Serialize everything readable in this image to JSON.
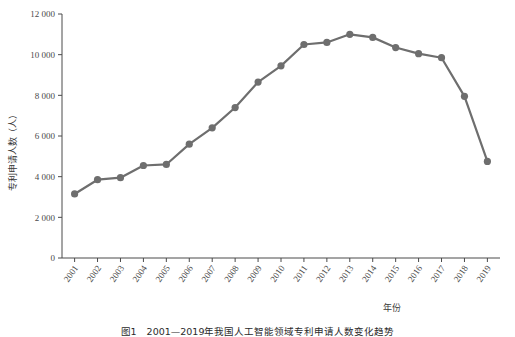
{
  "chart_data": {
    "type": "line",
    "title": "",
    "xlabel": "年份",
    "ylabel": "专利申请人数（人）",
    "categories": [
      "2001",
      "2002",
      "2003",
      "2004",
      "2005",
      "2006",
      "2007",
      "2008",
      "2009",
      "2010",
      "2011",
      "2012",
      "2013",
      "2014",
      "2015",
      "2016",
      "2017",
      "2018",
      "2019"
    ],
    "values": [
      3150,
      3850,
      3950,
      4550,
      4600,
      5600,
      6400,
      7400,
      8650,
      9450,
      10500,
      10600,
      11000,
      10850,
      10350,
      10050,
      9850,
      7950,
      4750
    ],
    "series": [
      {
        "name": "专利申请人数",
        "values": [
          3150,
          3850,
          3950,
          4550,
          4600,
          5600,
          6400,
          7400,
          8650,
          9450,
          10500,
          10600,
          11000,
          10850,
          10350,
          10050,
          9850,
          7950,
          4750
        ]
      }
    ],
    "ylim": [
      0,
      12000
    ],
    "ytick_labels": [
      "0",
      "2 000",
      "4 000",
      "6 000",
      "8 000",
      "10 000",
      "12 000"
    ],
    "ytick_values": [
      0,
      2000,
      4000,
      6000,
      8000,
      10000,
      12000
    ],
    "grid": false,
    "legend": "none",
    "marker": "circle",
    "line_color": "#6e6e6e",
    "marker_color": "#6e6e6e",
    "axis_color": "#4a4a4a"
  },
  "caption": {
    "text": "图1　2001—2019年我国人工智能领域专利申请人数变化趋势"
  }
}
